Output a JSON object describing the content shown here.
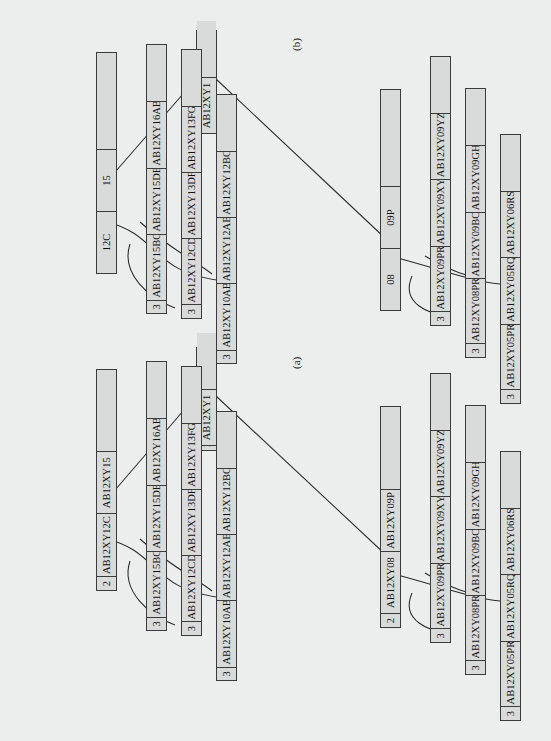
{
  "figure": {
    "panels": [
      {
        "id": "a",
        "caption": "(a)",
        "root": {
          "count": "1",
          "keys": [
            "AB12XY1"
          ],
          "empty_slots": 1
        },
        "level2": [
          {
            "count": "2",
            "keys": [
              "AB12XY12C",
              "AB12XY15"
            ],
            "empty_slots": 1
          },
          {
            "count": "2",
            "keys": [
              "AB12XY08",
              "AB12XY09P"
            ],
            "empty_slots": 1
          }
        ],
        "leaves": [
          {
            "count": "3",
            "keys": [
              "AB12XY10AB",
              "AB12XY12AB",
              "AB12XY12BC"
            ],
            "empty_slots": 1
          },
          {
            "count": "3",
            "keys": [
              "AB12XY12CD",
              "AB12XY13DF",
              "AB12XY13FG"
            ],
            "empty_slots": 1
          },
          {
            "count": "3",
            "keys": [
              "AB12XY15BC",
              "AB12XY15DE",
              "AB12XY16AB"
            ],
            "empty_slots": 1
          },
          {
            "count": "3",
            "keys": [
              "AB12XY05PR",
              "AB12XY05RQ",
              "AB12XY06RS"
            ],
            "empty_slots": 1
          },
          {
            "count": "3",
            "keys": [
              "AB12XY08PR",
              "AB12XY09BC",
              "AB12XY09GH"
            ],
            "empty_slots": 1
          },
          {
            "count": "3",
            "keys": [
              "AB12XY09PR",
              "AB12XY09XY",
              "AB12XY09YZ"
            ],
            "empty_slots": 1
          }
        ]
      },
      {
        "id": "b",
        "caption": "(b)",
        "root": {
          "count": "",
          "keys": [
            "AB12XY1"
          ],
          "empty_slots": 1
        },
        "level2": [
          {
            "count": "",
            "keys": [
              "12C",
              "15"
            ],
            "empty_slots": 1
          },
          {
            "count": "",
            "keys": [
              "08",
              "09P"
            ],
            "empty_slots": 1
          }
        ],
        "leaves": [
          {
            "count": "3",
            "keys": [
              "AB12XY10AB",
              "AB12XY12AB",
              "AB12XY12BC"
            ],
            "empty_slots": 1
          },
          {
            "count": "3",
            "keys": [
              "AB12XY12CD",
              "AB12XY13DF",
              "AB12XY13FG"
            ],
            "empty_slots": 1
          },
          {
            "count": "3",
            "keys": [
              "AB12XY15BC",
              "AB12XY15DE",
              "AB12XY16AB"
            ],
            "empty_slots": 1
          },
          {
            "count": "3",
            "keys": [
              "AB12XY05PR",
              "AB12XY05RQ",
              "AB12XY06RS"
            ],
            "empty_slots": 1
          },
          {
            "count": "3",
            "keys": [
              "AB12XY08PR",
              "AB12XY09BC",
              "AB12XY09GH"
            ],
            "empty_slots": 1
          },
          {
            "count": "3",
            "keys": [
              "AB12XY09PR",
              "AB12XY09XY",
              "AB12XY09YZ"
            ],
            "empty_slots": 1
          }
        ]
      }
    ],
    "colors": {
      "page_background": "#eceded",
      "node_fill": "#d9dada",
      "node_border": "#3b3b3b",
      "link_stroke": "#2b2b2b",
      "text": "#111111"
    }
  }
}
